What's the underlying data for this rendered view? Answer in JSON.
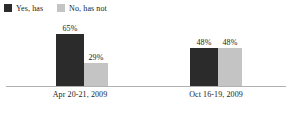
{
  "chart_data": {
    "type": "bar",
    "title": "",
    "subtitle": "",
    "xlabel": "",
    "ylabel": "",
    "ylim": [
      0,
      100
    ],
    "grid": false,
    "legend_position": "top-left",
    "categories": [
      "Apr 20-21, 2009",
      "Oct 16-19, 2009"
    ],
    "series": [
      {
        "name": "Yes, has",
        "color": "#2b2b2b",
        "values": [
          65,
          48
        ],
        "value_labels": [
          "65%",
          "48%"
        ]
      },
      {
        "name": "No, has not",
        "color": "#c4c4c4",
        "values": [
          29,
          48
        ],
        "value_labels": [
          "29%",
          "48%"
        ]
      }
    ]
  },
  "legend": {
    "items": [
      {
        "label": "Yes, has",
        "color": "#2b2b2b"
      },
      {
        "label": "No, has not",
        "color": "#c4c4c4"
      }
    ]
  },
  "axis": {
    "baseline_color": "#b0b0b0"
  }
}
